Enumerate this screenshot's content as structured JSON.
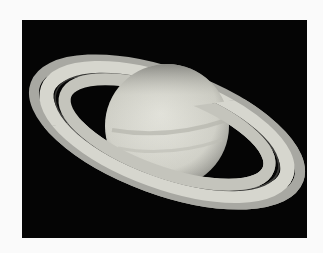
{
  "image": {
    "subject": "Saturn with rings",
    "background_color": "#fafafa",
    "frame_color": "#050505",
    "planet_color": "#d8d8d0",
    "ring_color": "#cfcfc8"
  }
}
